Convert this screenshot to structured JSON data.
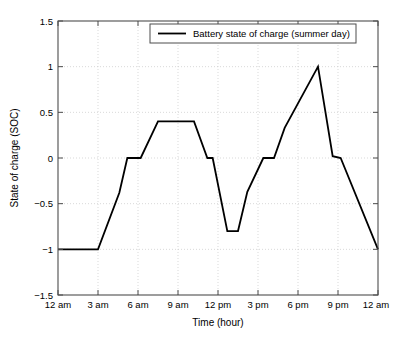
{
  "figure": {
    "background_color": "#ffffff",
    "plot_area": {
      "left": 58,
      "top": 21,
      "right": 378,
      "bottom": 295
    }
  },
  "chart_data": {
    "type": "line",
    "title": "",
    "xlabel": "Time (hour)",
    "ylabel": "State of charge (SOC)",
    "xlim": [
      0,
      24
    ],
    "ylim": [
      -1.5,
      1.5
    ],
    "grid": true,
    "grid_style": "dotted",
    "legend_position": "top-center",
    "xticks": [
      0,
      3,
      6,
      9,
      12,
      15,
      18,
      21,
      24
    ],
    "xtick_labels": [
      "12 am",
      "3 am",
      "6 am",
      "9 am",
      "12 pm",
      "3 pm",
      "6 pm",
      "9 pm",
      "12 am"
    ],
    "yticks": [
      -1.5,
      -1,
      -0.5,
      0,
      0.5,
      1,
      1.5
    ],
    "ytick_labels": [
      "−1.5",
      "−1",
      "−0.5",
      "0",
      "0.5",
      "1",
      "1.5"
    ],
    "series": [
      {
        "name": "Battery state of charge (summer day)",
        "color": "#000000",
        "line_width": 1.8,
        "x": [
          0,
          3,
          4.6,
          5.2,
          6.2,
          7.5,
          10.2,
          11.2,
          11.6,
          12.7,
          13.5,
          14.2,
          15.4,
          16.2,
          17.0,
          19.5,
          20.6,
          21.2,
          24
        ],
        "y": [
          -1,
          -1,
          -0.38,
          0,
          0,
          0.4,
          0.4,
          0,
          0,
          -0.8,
          -0.8,
          -0.37,
          0,
          0,
          0.33,
          1,
          0.02,
          0,
          -1
        ],
        "values_note": "Battery state of charge over a 24 hour summer day"
      }
    ],
    "points_of_interest": {
      "overnight_floor": -1,
      "morning_plateau": 0.4,
      "midday_minimum": -0.8,
      "evening_peak": 1,
      "end_of_day": -1
    }
  },
  "legend": {
    "entries": [
      {
        "label": "Battery state of charge (summer day)",
        "color": "#000000"
      }
    ]
  }
}
